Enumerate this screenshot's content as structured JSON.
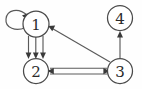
{
  "diagram": {
    "type": "directed-graph",
    "background_color": "#fefefe",
    "node_stroke_color": "#4a4a4a",
    "node_fill_color": "#ffffff",
    "edge_color": "#5a5a5a",
    "arrow_color": "#3a3a3a",
    "label_color": "#2b2b2b",
    "nodes": [
      {
        "id": "1",
        "label": "1",
        "cx": 36,
        "cy": 24,
        "r": 13
      },
      {
        "id": "2",
        "label": "2",
        "cx": 36,
        "cy": 71,
        "r": 12.5
      },
      {
        "id": "3",
        "label": "3",
        "cx": 120,
        "cy": 71,
        "r": 12.5
      },
      {
        "id": "4",
        "label": "4",
        "cx": 120,
        "cy": 18,
        "r": 12.5
      }
    ],
    "edges": [
      {
        "from": "1",
        "to": "1",
        "kind": "self-loop",
        "multiplicity": 1,
        "arrow_at": "1"
      },
      {
        "from": "1",
        "to": "2",
        "kind": "straight",
        "multiplicity": 3,
        "arrow_at": "2"
      },
      {
        "from": "3",
        "to": "1",
        "kind": "straight",
        "multiplicity": 1,
        "arrow_at": "1"
      },
      {
        "from": "2",
        "to": "3",
        "kind": "straight",
        "multiplicity": 2,
        "arrow_at": "both"
      },
      {
        "from": "3",
        "to": "4",
        "kind": "straight",
        "multiplicity": 1,
        "arrow_at": "4"
      }
    ]
  }
}
